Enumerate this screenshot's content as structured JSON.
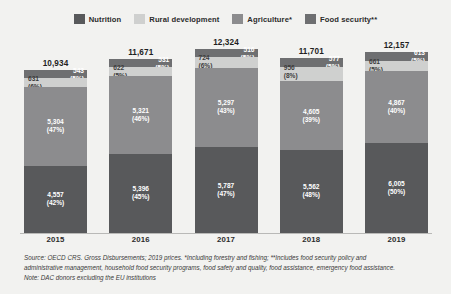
{
  "legend": {
    "items": [
      {
        "label": "Nutrition",
        "color": "#58595b",
        "swatch_name": "legend-swatch-nutrition"
      },
      {
        "label": "Rural development",
        "color": "#cfd0cf",
        "swatch_name": "legend-swatch-rural-development"
      },
      {
        "label": "Agriculture*",
        "color": "#8c8c8e",
        "swatch_name": "legend-swatch-agriculture"
      },
      {
        "label": "Food security**",
        "color": "#6e6f71",
        "swatch_name": "legend-swatch-food-security"
      }
    ]
  },
  "footnote": {
    "line1": "Source: OECD CRS. Gross Disbursements; 2019 prices. *Including forestry and fishing; **Includes food security policy and",
    "line2": "administrative management, household food security programs, food safety and quality, food assistance, emergency food assistance.",
    "line3": "Note: DAC donors excluding the EU institutions"
  },
  "chart_data": {
    "type": "bar",
    "subtype": "stacked-bar",
    "title": "",
    "xlabel": "",
    "ylabel": "",
    "grid": false,
    "legend_position": "top-center",
    "categories": [
      "2015",
      "2016",
      "2017",
      "2018",
      "2019"
    ],
    "totals": [
      "10,934",
      "11,671",
      "12,324",
      "11,701",
      "12,157"
    ],
    "totals_numeric": [
      10934,
      11671,
      12324,
      11701,
      12157
    ],
    "ylim": [
      0,
      12324
    ],
    "series": [
      {
        "name": "Nutrition",
        "color": "#58595b",
        "values": [
          4557,
          5396,
          5787,
          5562,
          6005
        ],
        "value_labels": [
          "4,557",
          "5,396",
          "5,787",
          "5,562",
          "6,005"
        ],
        "percent_labels": [
          "(42%)",
          "(45%)",
          "(47%)",
          "(48%)",
          "(50%)"
        ]
      },
      {
        "name": "Rural development",
        "color": "#8c8c8e",
        "values": [
          5304,
          5321,
          5297,
          4605,
          4867
        ],
        "value_labels": [
          "5,304",
          "5,321",
          "5,297",
          "4,605",
          "4,867"
        ],
        "percent_labels": [
          "(47%)",
          "(46%)",
          "(43%)",
          "(39%)",
          "(40%)"
        ]
      },
      {
        "name": "Agriculture*",
        "color": "#cfd0cf",
        "values": [
          631,
          622,
          724,
          956,
          661
        ],
        "value_labels": [
          "631",
          "622",
          "724",
          "956",
          "661"
        ],
        "percent_labels": [
          "(6%)",
          "(5%)",
          "(6%)",
          "(8%)",
          "(5%)"
        ]
      },
      {
        "name": "Food security**",
        "color": "#6e6f71",
        "values": [
          543,
          531,
          516,
          577,
          613
        ],
        "value_labels": [
          "543",
          "531",
          "516",
          "577",
          "613"
        ],
        "percent_labels": [
          "(5%)",
          "(5%)",
          "(5%)",
          "(5%)",
          "(5%)"
        ]
      }
    ]
  }
}
